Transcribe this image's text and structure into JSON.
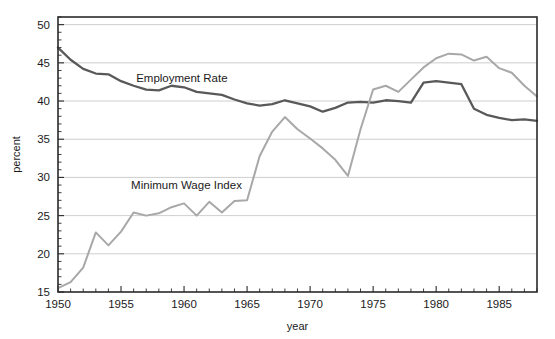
{
  "chart_data": {
    "type": "line",
    "title": "",
    "xlabel": "year",
    "ylabel": "percent",
    "xlim": [
      1950,
      1988
    ],
    "ylim": [
      15,
      51
    ],
    "grid": true,
    "grid_axis": "y",
    "legend_position": "inline-annotations",
    "x_ticks": [
      1950,
      1955,
      1960,
      1965,
      1970,
      1975,
      1980,
      1985
    ],
    "x_tick_labels": [
      "1950",
      "1955",
      "1960",
      "1965",
      "1970",
      "1975",
      "1980",
      "1985"
    ],
    "x_minor_tick_step": 1,
    "y_ticks": [
      15,
      20,
      25,
      30,
      35,
      40,
      45,
      50
    ],
    "y_tick_labels": [
      "15",
      "20",
      "25",
      "30",
      "35",
      "40",
      "45",
      "50"
    ],
    "y_minor_tick_step": 1,
    "x": [
      1950,
      1951,
      1952,
      1953,
      1954,
      1955,
      1956,
      1957,
      1958,
      1959,
      1960,
      1961,
      1962,
      1963,
      1964,
      1965,
      1966,
      1967,
      1968,
      1969,
      1970,
      1971,
      1972,
      1973,
      1974,
      1975,
      1976,
      1977,
      1978,
      1979,
      1980,
      1981,
      1982,
      1983,
      1984,
      1985,
      1986,
      1987,
      1988
    ],
    "series": [
      {
        "name": "Employment Rate",
        "color": "#595959",
        "label_x": 1956.2,
        "label_y": 43.0,
        "values": [
          47.0,
          45.4,
          44.2,
          43.6,
          43.5,
          42.6,
          42.0,
          41.5,
          41.4,
          42.0,
          41.8,
          41.2,
          41.0,
          40.8,
          40.2,
          39.7,
          39.4,
          39.6,
          40.1,
          39.7,
          39.3,
          38.6,
          39.1,
          39.8,
          39.9,
          39.8,
          40.1,
          40.0,
          39.8,
          42.4,
          42.6,
          42.4,
          42.2,
          39.0,
          38.2,
          37.8,
          37.5,
          37.6,
          37.4
        ]
      },
      {
        "name": "Minimum Wage Index",
        "color": "#a8a8a8",
        "label_x": 1955.8,
        "label_y": 29.0,
        "values": [
          15.5,
          16.3,
          18.2,
          22.8,
          21.1,
          22.9,
          25.4,
          25.0,
          25.3,
          26.1,
          26.6,
          25.0,
          26.8,
          25.4,
          26.9,
          27.0,
          32.8,
          36.0,
          37.9,
          36.3,
          35.1,
          33.8,
          32.3,
          30.2,
          36.3,
          41.5,
          42.0,
          41.2,
          42.8,
          44.4,
          45.6,
          46.2,
          46.1,
          45.3,
          45.8,
          44.3,
          43.7,
          42.0,
          40.6
        ]
      }
    ]
  },
  "series_fix": {
    "employment": [
      47.0,
      45.4,
      44.2,
      43.6,
      43.5,
      42.6,
      42.0,
      41.5,
      41.4,
      42.0,
      41.8,
      41.2,
      41.0,
      40.8,
      40.2,
      39.7,
      39.4,
      39.6,
      40.1,
      39.7,
      39.3,
      38.6,
      39.1,
      39.8,
      39.9,
      39.8,
      40.1,
      40.0,
      39.8,
      42.4,
      42.6,
      42.4,
      42.2,
      39.0,
      38.2,
      37.8,
      37.5,
      37.6,
      37.4
    ],
    "minwage": [
      15.5,
      16.3,
      18.2,
      22.8,
      21.1,
      22.9,
      25.4,
      25.0,
      25.3,
      26.1,
      26.6,
      25.0,
      26.8,
      25.4,
      26.9,
      27.0,
      32.8,
      36.0,
      37.9,
      36.3,
      35.1,
      33.8,
      32.3,
      30.2,
      36.3,
      41.5,
      42.0,
      41.2,
      42.8,
      44.4,
      45.6,
      46.2,
      46.1,
      45.3,
      45.8,
      44.3,
      43.7,
      42.0,
      40.6
    ]
  },
  "plot_geometry": {
    "left": 58,
    "right": 537,
    "top": 17,
    "bottom": 292
  }
}
